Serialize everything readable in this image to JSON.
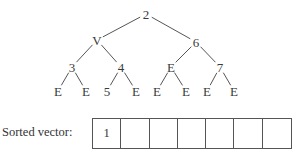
{
  "tree": {
    "nodes": [
      {
        "id": "n0",
        "label": "2",
        "x": 146,
        "y": 14
      },
      {
        "id": "n1",
        "label": "V",
        "x": 97,
        "y": 40
      },
      {
        "id": "n2",
        "label": "6",
        "x": 196,
        "y": 42
      },
      {
        "id": "n3",
        "label": "3",
        "x": 72,
        "y": 67
      },
      {
        "id": "n4",
        "label": "4",
        "x": 121,
        "y": 67
      },
      {
        "id": "n5",
        "label": "E",
        "x": 171,
        "y": 67
      },
      {
        "id": "n6",
        "label": "7",
        "x": 220,
        "y": 67
      },
      {
        "id": "n7",
        "label": "E",
        "x": 58,
        "y": 91
      },
      {
        "id": "n8",
        "label": "E",
        "x": 86,
        "y": 91
      },
      {
        "id": "n9",
        "label": "5",
        "x": 107,
        "y": 91
      },
      {
        "id": "n10",
        "label": "E",
        "x": 136,
        "y": 91
      },
      {
        "id": "n11",
        "label": "E",
        "x": 157,
        "y": 91
      },
      {
        "id": "n12",
        "label": "E",
        "x": 186,
        "y": 91
      },
      {
        "id": "n13",
        "label": "E",
        "x": 207,
        "y": 91
      },
      {
        "id": "n14",
        "label": "E",
        "x": 234,
        "y": 91
      }
    ],
    "edges": [
      [
        "n0",
        "n1"
      ],
      [
        "n0",
        "n2"
      ],
      [
        "n1",
        "n3"
      ],
      [
        "n1",
        "n4"
      ],
      [
        "n2",
        "n5"
      ],
      [
        "n2",
        "n6"
      ],
      [
        "n3",
        "n7"
      ],
      [
        "n3",
        "n8"
      ],
      [
        "n4",
        "n9"
      ],
      [
        "n4",
        "n10"
      ],
      [
        "n5",
        "n11"
      ],
      [
        "n5",
        "n12"
      ],
      [
        "n6",
        "n13"
      ],
      [
        "n6",
        "n14"
      ]
    ]
  },
  "sorted_vector": {
    "label": "Sorted vector:",
    "cells": [
      "1",
      "",
      "",
      "",
      "",
      "",
      ""
    ]
  }
}
